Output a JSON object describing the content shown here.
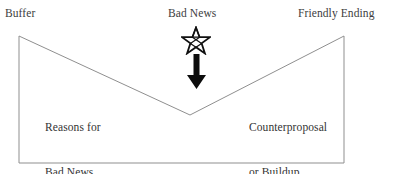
{
  "figure": {
    "type": "bad-news-letter-structure-diagram",
    "background_color": "#ffffff",
    "outline_color": "#8f8f8f",
    "text_color": "#333333",
    "mark_color": "#111111"
  },
  "top_labels": {
    "left": "Buffer",
    "center": "Bad News",
    "right": "Friendly Ending"
  },
  "inner_labels": {
    "left_line1": "Reasons for",
    "left_line2": "Bad News",
    "right_line1": "Counterproposal",
    "right_line2": "or Buildup"
  },
  "marks": {
    "star": "star-icon",
    "arrow": "arrow-down-icon"
  },
  "shape": {
    "name": "envelope-outline",
    "points": "19,36 190,115 344,36 344,163 19,163",
    "top_left": [
      19,
      36
    ],
    "valley": [
      190,
      115
    ],
    "top_right": [
      344,
      36
    ],
    "bottom_right": [
      344,
      163
    ],
    "bottom_left": [
      19,
      163
    ]
  }
}
